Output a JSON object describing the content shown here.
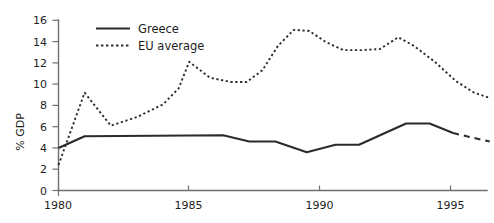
{
  "chart_data": {
    "type": "line",
    "title": "",
    "xlabel": "",
    "ylabel": "% GDP",
    "xlim": [
      1980,
      1996.5
    ],
    "ylim": [
      0,
      16
    ],
    "grid": false,
    "legend_position": "top-center",
    "xticks": [
      1980,
      1985,
      1990,
      1995
    ],
    "xtick_labels": [
      "1980",
      "1985",
      "1990",
      "1995"
    ],
    "yticks": [
      0,
      2,
      4,
      6,
      8,
      10,
      12,
      14,
      16
    ],
    "ytick_labels": [
      "0",
      "2",
      "4",
      "6",
      "8",
      "10",
      "12",
      "14",
      "16"
    ],
    "x": [
      1980,
      1981,
      1982,
      1983,
      1984,
      1985,
      1986,
      1987,
      1988,
      1989,
      1990,
      1991,
      1992,
      1993,
      1994,
      1995,
      1996.5
    ],
    "series": [
      {
        "name": "Greece",
        "style": "solid",
        "values": [
          4.0,
          5.1,
          5.2,
          5.2,
          5.2,
          5.2,
          5.2,
          4.7,
          4.6,
          3.6,
          3.7,
          4.3,
          4.4,
          6.3,
          6.5,
          5.6,
          4.7
        ],
        "dashed_tail_from": 1995
      },
      {
        "name": "EU average",
        "style": "dashed",
        "values": [
          2.4,
          9.2,
          6.1,
          6.6,
          7.2,
          8.0,
          9.6,
          12.1,
          10.4,
          10.3,
          11.0,
          13.6,
          15.1,
          15.2,
          13.2,
          13.3,
          13.3
        ],
        "values_note": "see points_dashed for drawn vertex list"
      }
    ],
    "points_dashed": [
      {
        "x": 1980.0,
        "y": 2.4
      },
      {
        "x": 1981.0,
        "y": 9.2
      },
      {
        "x": 1982.0,
        "y": 6.1
      },
      {
        "x": 1983.0,
        "y": 6.9
      },
      {
        "x": 1984.0,
        "y": 8.1
      },
      {
        "x": 1984.6,
        "y": 9.6
      },
      {
        "x": 1985.0,
        "y": 12.1
      },
      {
        "x": 1985.8,
        "y": 10.6
      },
      {
        "x": 1986.6,
        "y": 10.2
      },
      {
        "x": 1987.2,
        "y": 10.2
      },
      {
        "x": 1987.8,
        "y": 11.3
      },
      {
        "x": 1988.4,
        "y": 13.6
      },
      {
        "x": 1989.0,
        "y": 15.1
      },
      {
        "x": 1989.6,
        "y": 15.0
      },
      {
        "x": 1990.2,
        "y": 14.0
      },
      {
        "x": 1990.9,
        "y": 13.2
      },
      {
        "x": 1991.6,
        "y": 13.2
      },
      {
        "x": 1992.3,
        "y": 13.3
      },
      {
        "x": 1993.0,
        "y": 14.4
      },
      {
        "x": 1993.6,
        "y": 13.6
      },
      {
        "x": 1994.4,
        "y": 12.1
      },
      {
        "x": 1995.2,
        "y": 10.3
      },
      {
        "x": 1995.9,
        "y": 9.2
      },
      {
        "x": 1996.5,
        "y": 8.7
      }
    ],
    "points_solid": [
      {
        "x": 1980.0,
        "y": 4.0
      },
      {
        "x": 1981.0,
        "y": 5.1
      },
      {
        "x": 1986.3,
        "y": 5.2
      },
      {
        "x": 1987.3,
        "y": 4.6
      },
      {
        "x": 1988.3,
        "y": 4.6
      },
      {
        "x": 1989.5,
        "y": 3.6
      },
      {
        "x": 1990.6,
        "y": 4.3
      },
      {
        "x": 1991.5,
        "y": 4.3
      },
      {
        "x": 1993.3,
        "y": 6.3
      },
      {
        "x": 1994.2,
        "y": 6.3
      },
      {
        "x": 1995.1,
        "y": 5.4
      }
    ],
    "points_solid_tail": [
      {
        "x": 1995.1,
        "y": 5.4
      },
      {
        "x": 1996.5,
        "y": 4.6
      }
    ]
  },
  "legend": {
    "items": [
      {
        "label": "Greece",
        "style": "solid"
      },
      {
        "label": "EU average",
        "style": "dashed"
      }
    ]
  }
}
